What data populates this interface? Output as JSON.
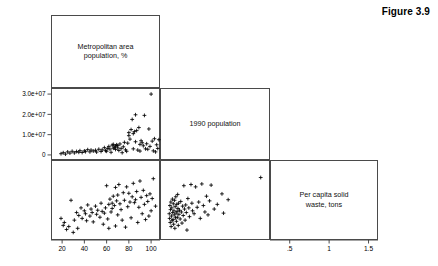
{
  "figure": {
    "title": "Figure 3.9",
    "type": "scatter-plot-matrix"
  },
  "variables": [
    {
      "key": "metro_pct",
      "label": "Metropolitan area\npopulation, %"
    },
    {
      "key": "pop_1990",
      "label": "1990 population"
    },
    {
      "key": "waste_per_capita",
      "label": "Per capita solid\nwaste, tons"
    }
  ],
  "diagonal_labels": {
    "panel_1": "Metropolitan area\npopulation, %",
    "panel_2": "1990 population",
    "panel_3": "Per capita solid\nwaste, tons"
  },
  "axes": {
    "metro_pct": {
      "tick_labels": [
        "20",
        "40",
        "60",
        "80",
        "100"
      ],
      "tick_values": [
        20,
        40,
        60,
        80,
        100
      ],
      "range": [
        10,
        108
      ],
      "position": "bottom",
      "label": "Metropolitan area population, %"
    },
    "pop_1990": {
      "tick_labels": [
        "0",
        "1.0e+07",
        "2.0e+07",
        "3.0e+07"
      ],
      "tick_values": [
        0,
        10000000,
        20000000,
        30000000
      ],
      "range": [
        -2500000,
        33000000
      ],
      "position": "left",
      "label": "1990 population"
    },
    "waste_per_capita": {
      "tick_labels": [
        ".5",
        "1",
        "1.5"
      ],
      "tick_values": [
        0.5,
        1.0,
        1.5
      ],
      "range": [
        0.25,
        1.62
      ],
      "position": "bottom",
      "label": "Per capita solid waste, tons"
    }
  },
  "chart_data": {
    "type": "scatter",
    "title": "Figure 3.9",
    "layout": "scatter-plot-matrix-lower-triangular",
    "grid": false,
    "legend": "none",
    "variables": [
      "Metropolitan area population, %",
      "1990 population",
      "Per capita solid waste, tons"
    ],
    "panels": [
      {
        "row": 1,
        "col": 1,
        "kind": "diagonal",
        "text": "Metropolitan area population, %"
      },
      {
        "row": 2,
        "col": 1,
        "kind": "scatter",
        "xlabel": "Metropolitan area population, %",
        "ylabel": "1990 population",
        "xlim": [
          10,
          108
        ],
        "ylim": [
          -2500000,
          33000000
        ],
        "points": [
          [
            19,
            600000
          ],
          [
            21,
            1100000
          ],
          [
            23,
            400000
          ],
          [
            25,
            1500000
          ],
          [
            27,
            900000
          ],
          [
            29,
            1800000
          ],
          [
            31,
            1000000
          ],
          [
            33,
            1700000
          ],
          [
            35,
            1300000
          ],
          [
            36,
            2100000
          ],
          [
            38,
            1200000
          ],
          [
            40,
            2000000
          ],
          [
            41,
            1600000
          ],
          [
            43,
            2600000
          ],
          [
            45,
            1500000
          ],
          [
            46,
            2400000
          ],
          [
            48,
            1900000
          ],
          [
            50,
            2300000
          ],
          [
            51,
            1400000
          ],
          [
            53,
            2800000
          ],
          [
            55,
            1700000
          ],
          [
            56,
            2500000
          ],
          [
            58,
            3600000
          ],
          [
            59,
            2100000
          ],
          [
            60,
            1800000
          ],
          [
            61,
            3200000
          ],
          [
            62,
            4200000
          ],
          [
            63,
            2900000
          ],
          [
            64,
            1300000
          ],
          [
            65,
            4800000
          ],
          [
            66,
            3300000
          ],
          [
            66,
            5200000
          ],
          [
            67,
            3800000
          ],
          [
            68,
            4400000
          ],
          [
            68,
            2700000
          ],
          [
            69,
            5000000
          ],
          [
            70,
            3500000
          ],
          [
            70,
            4600000
          ],
          [
            71,
            2200000
          ],
          [
            72,
            5400000
          ],
          [
            73,
            3100000
          ],
          [
            74,
            1100000
          ],
          [
            75,
            4000000
          ],
          [
            76,
            6200000
          ],
          [
            77,
            2500000
          ],
          [
            78,
            1800000
          ],
          [
            79,
            5800000
          ],
          [
            80,
            9500000
          ],
          [
            80,
            11000000
          ],
          [
            81,
            7800000
          ],
          [
            82,
            12500000
          ],
          [
            83,
            17500000
          ],
          [
            84,
            10500000
          ],
          [
            84,
            3000000
          ],
          [
            85,
            11500000
          ],
          [
            86,
            6500000
          ],
          [
            86,
            19800000
          ],
          [
            87,
            12000000
          ],
          [
            88,
            2400000
          ],
          [
            89,
            13500000
          ],
          [
            90,
            5200000
          ],
          [
            90,
            1900000
          ],
          [
            91,
            7000000
          ],
          [
            92,
            6000000
          ],
          [
            93,
            4500000
          ],
          [
            94,
            19500000
          ],
          [
            95,
            3000000
          ],
          [
            96,
            5500000
          ],
          [
            97,
            2800000
          ],
          [
            98,
            12800000
          ],
          [
            99,
            4200000
          ],
          [
            100,
            30000000
          ],
          [
            101,
            6800000
          ],
          [
            102,
            2000000
          ],
          [
            103,
            8000000
          ],
          [
            104,
            1500000
          ],
          [
            105,
            5000000
          ],
          [
            106,
            3200000
          ],
          [
            107,
            7500000
          ]
        ]
      },
      {
        "row": 2,
        "col": 2,
        "kind": "diagonal",
        "text": "1990 population"
      },
      {
        "row": 3,
        "col": 1,
        "kind": "scatter",
        "xlabel": "Metropolitan area population, %",
        "ylabel": "Per capita solid waste, tons",
        "xlim": [
          10,
          108
        ],
        "ylim": [
          0.25,
          1.62
        ],
        "points": [
          [
            19,
            0.62
          ],
          [
            21,
            0.5
          ],
          [
            22,
            0.55
          ],
          [
            24,
            0.43
          ],
          [
            26,
            0.48
          ],
          [
            28,
            0.93
          ],
          [
            30,
            0.38
          ],
          [
            31,
            0.59
          ],
          [
            33,
            0.72
          ],
          [
            34,
            0.45
          ],
          [
            35,
            0.67
          ],
          [
            37,
            0.8
          ],
          [
            38,
            0.62
          ],
          [
            40,
            0.75
          ],
          [
            41,
            0.7
          ],
          [
            42,
            0.58
          ],
          [
            43,
            0.85
          ],
          [
            45,
            0.66
          ],
          [
            46,
            0.78
          ],
          [
            47,
            0.72
          ],
          [
            48,
            0.56
          ],
          [
            50,
            0.83
          ],
          [
            51,
            0.69
          ],
          [
            52,
            0.76
          ],
          [
            54,
            0.64
          ],
          [
            55,
            0.88
          ],
          [
            56,
            0.74
          ],
          [
            57,
            0.52
          ],
          [
            58,
            0.71
          ],
          [
            59,
            0.8
          ],
          [
            60,
            1.18
          ],
          [
            61,
            0.61
          ],
          [
            62,
            0.86
          ],
          [
            62,
            0.45
          ],
          [
            63,
            0.95
          ],
          [
            64,
            0.73
          ],
          [
            65,
            0.88
          ],
          [
            65,
            0.79
          ],
          [
            66,
            1.0
          ],
          [
            67,
            0.84
          ],
          [
            68,
            1.15
          ],
          [
            68,
            0.49
          ],
          [
            69,
            0.92
          ],
          [
            70,
            1.02
          ],
          [
            70,
            0.68
          ],
          [
            71,
            1.2
          ],
          [
            72,
            0.87
          ],
          [
            73,
            0.77
          ],
          [
            74,
            0.59
          ],
          [
            75,
            1.06
          ],
          [
            76,
            0.93
          ],
          [
            77,
            0.47
          ],
          [
            78,
            1.16
          ],
          [
            79,
            0.82
          ],
          [
            80,
            1.05
          ],
          [
            81,
            0.9
          ],
          [
            82,
            0.63
          ],
          [
            83,
            0.99
          ],
          [
            84,
            1.22
          ],
          [
            85,
            0.89
          ],
          [
            86,
            0.94
          ],
          [
            87,
            1.08
          ],
          [
            88,
            0.55
          ],
          [
            89,
            0.81
          ],
          [
            90,
            1.26
          ],
          [
            91,
            0.98
          ],
          [
            92,
            0.7
          ],
          [
            93,
            1.1
          ],
          [
            94,
            0.86
          ],
          [
            95,
            0.6
          ],
          [
            96,
            1.01
          ],
          [
            97,
            0.91
          ],
          [
            98,
            0.66
          ],
          [
            99,
            1.04
          ],
          [
            100,
            0.75
          ],
          [
            101,
            0.96
          ],
          [
            102,
            1.3
          ],
          [
            104,
            0.83
          ]
        ]
      },
      {
        "row": 3,
        "col": 2,
        "kind": "scatter",
        "xlabel": "1990 population",
        "ylabel": "Per capita solid waste, tons",
        "xlim": [
          -2500000,
          33000000
        ],
        "ylim": [
          0.25,
          1.62
        ],
        "points": [
          [
            500000,
            0.7
          ],
          [
            600000,
            0.62
          ],
          [
            700000,
            0.84
          ],
          [
            800000,
            0.55
          ],
          [
            900000,
            0.77
          ],
          [
            1000000,
            0.9
          ],
          [
            1100000,
            0.48
          ],
          [
            1200000,
            0.66
          ],
          [
            1300000,
            0.8
          ],
          [
            1400000,
            0.58
          ],
          [
            1500000,
            0.95
          ],
          [
            1600000,
            0.72
          ],
          [
            1700000,
            0.6
          ],
          [
            1800000,
            0.87
          ],
          [
            1900000,
            0.52
          ],
          [
            2000000,
            0.75
          ],
          [
            2100000,
            0.68
          ],
          [
            2200000,
            0.93
          ],
          [
            2300000,
            0.45
          ],
          [
            2400000,
            0.82
          ],
          [
            2500000,
            0.63
          ],
          [
            2600000,
            0.99
          ],
          [
            2700000,
            0.71
          ],
          [
            2800000,
            0.57
          ],
          [
            2900000,
            0.86
          ],
          [
            3000000,
            0.74
          ],
          [
            3100000,
            0.64
          ],
          [
            3200000,
            1.03
          ],
          [
            3300000,
            0.79
          ],
          [
            3400000,
            0.5
          ],
          [
            3500000,
            0.88
          ],
          [
            3600000,
            0.69
          ],
          [
            3800000,
            0.76
          ],
          [
            4000000,
            0.61
          ],
          [
            4200000,
            0.91
          ],
          [
            4400000,
            0.73
          ],
          [
            4600000,
            0.54
          ],
          [
            4800000,
            0.83
          ],
          [
            5000000,
            0.67
          ],
          [
            5200000,
            1.18
          ],
          [
            5400000,
            0.78
          ],
          [
            5600000,
            0.59
          ],
          [
            5800000,
            0.85
          ],
          [
            6000000,
            0.72
          ],
          [
            6200000,
            0.42
          ],
          [
            6500000,
            0.96
          ],
          [
            6800000,
            0.8
          ],
          [
            7000000,
            0.65
          ],
          [
            7500000,
            1.2
          ],
          [
            7800000,
            0.88
          ],
          [
            8000000,
            0.75
          ],
          [
            8500000,
            0.7
          ],
          [
            9000000,
            1.16
          ],
          [
            9500000,
            0.81
          ],
          [
            10000000,
            0.9
          ],
          [
            10500000,
            0.62
          ],
          [
            11000000,
            1.21
          ],
          [
            11500000,
            0.84
          ],
          [
            12000000,
            0.73
          ],
          [
            12500000,
            1.0
          ],
          [
            13000000,
            0.68
          ],
          [
            13500000,
            0.92
          ],
          [
            14000000,
            1.19
          ],
          [
            15000000,
            0.78
          ],
          [
            16000000,
            0.86
          ],
          [
            17500000,
            1.04
          ],
          [
            18000000,
            0.71
          ],
          [
            19500000,
            0.94
          ],
          [
            30000000,
            1.32
          ]
        ]
      },
      {
        "row": 3,
        "col": 3,
        "kind": "diagonal",
        "text": "Per capita solid waste, tons"
      }
    ]
  },
  "colors": {
    "frame": "#4a4a4a",
    "marker": "#000000",
    "text": "#000000",
    "background": "#ffffff"
  }
}
